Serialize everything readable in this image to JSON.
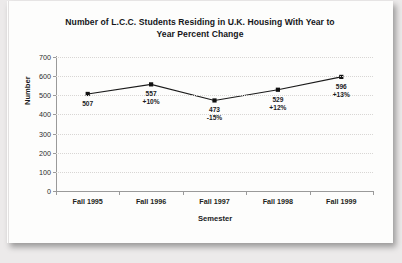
{
  "document": {
    "kind": "scanned-chart-page"
  },
  "chart_data": {
    "type": "line",
    "title": "Number of L.C.C. Students Residing in U.K. Housing With Year to Year Percent Change",
    "title_line1": "Number of L.C.C. Students Residing in U.K. Housing With Year to",
    "title_line2": "Year Percent Change",
    "xlabel": "Semester",
    "ylabel": "Number",
    "categories": [
      "Fall 1995",
      "Fall 1996",
      "Fall 1997",
      "Fall 1998",
      "Fall 1999"
    ],
    "values": [
      507,
      557,
      473,
      529,
      596
    ],
    "percent_change": [
      "",
      "+10%",
      "-15%",
      "+12%",
      "+13%"
    ],
    "point_labels": [
      {
        "value": "507",
        "change": ""
      },
      {
        "value": "557",
        "change": "+10%"
      },
      {
        "value": "473",
        "change": "-15%"
      },
      {
        "value": "529",
        "change": "+12%"
      },
      {
        "value": "596",
        "change": "+13%"
      }
    ],
    "ylim": [
      0,
      700
    ],
    "ytick_labels": [
      "700",
      "600",
      "500",
      "400",
      "300",
      "200",
      "100",
      "0"
    ],
    "ytick_values": [
      700,
      600,
      500,
      400,
      300,
      200,
      100,
      0
    ],
    "ytick_step": 100,
    "grid": true,
    "grid_axis": "y",
    "legend": false,
    "marker": "square",
    "series_color": "#1a1a1a",
    "marker_color": "#111111",
    "grid_color": "#d8d6d4",
    "axis_color": "#9a9a9a",
    "background_color": "#fdfdfc"
  }
}
